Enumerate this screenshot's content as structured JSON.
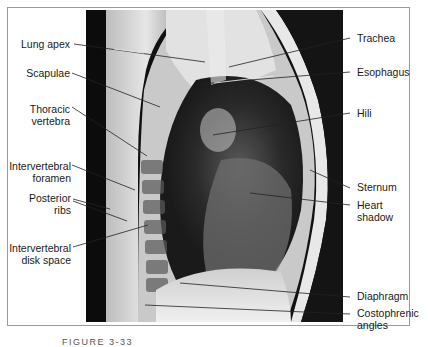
{
  "figure": {
    "caption": "FIGURE 3-33",
    "image_description": "Lateral chest radiograph"
  },
  "labels_left": [
    {
      "id": "lung-apex",
      "lines": [
        "Lung apex"
      ]
    },
    {
      "id": "scapulae",
      "lines": [
        "Scapulae"
      ]
    },
    {
      "id": "thoracic-vertebra",
      "lines": [
        "Thoracic",
        "vertebra"
      ]
    },
    {
      "id": "intervertebral-foramen",
      "lines": [
        "Intervertebral",
        "foramen"
      ]
    },
    {
      "id": "posterior-ribs",
      "lines": [
        "Posterior",
        "ribs"
      ]
    },
    {
      "id": "intervertebral-disk-space",
      "lines": [
        "Intervertebral",
        "disk space"
      ]
    }
  ],
  "labels_right": [
    {
      "id": "trachea",
      "lines": [
        "Trachea"
      ]
    },
    {
      "id": "esophagus",
      "lines": [
        "Esophagus"
      ]
    },
    {
      "id": "hili",
      "lines": [
        "Hili"
      ]
    },
    {
      "id": "sternum",
      "lines": [
        "Sternum"
      ]
    },
    {
      "id": "heart-shadow",
      "lines": [
        "Heart",
        "shadow"
      ]
    },
    {
      "id": "diaphragm",
      "lines": [
        "Diaphragm"
      ]
    },
    {
      "id": "costophrenic-angles",
      "lines": [
        "Costophrenic",
        "angles"
      ]
    }
  ]
}
